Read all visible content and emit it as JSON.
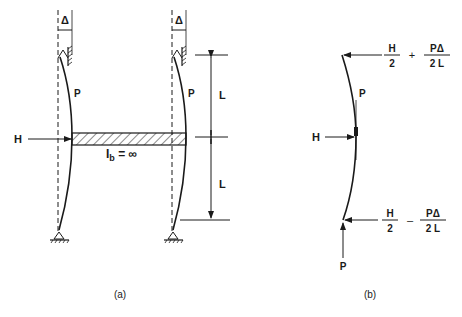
{
  "figure": {
    "panel_a": {
      "caption": "(a)",
      "delta_symbol": "Δ",
      "load_label": "P",
      "horizontal_load_label": "H",
      "beam_label_main": "I",
      "beam_label_sub": "b",
      "beam_label_rest": " = ∞",
      "span_label_upper": "L",
      "span_label_lower": "L"
    },
    "panel_b": {
      "caption": "(b)",
      "load_label_top": "P",
      "load_label_bottom": "P",
      "horizontal_load_label": "H",
      "top_reaction": {
        "term1_num": "H",
        "term1_den": "2",
        "operator": "+",
        "term2_num": "PΔ",
        "term2_den": "2 L"
      },
      "bottom_reaction": {
        "term1_num": "H",
        "term1_den": "2",
        "operator": "–",
        "term2_num": "PΔ",
        "term2_den": "2 L"
      }
    }
  }
}
